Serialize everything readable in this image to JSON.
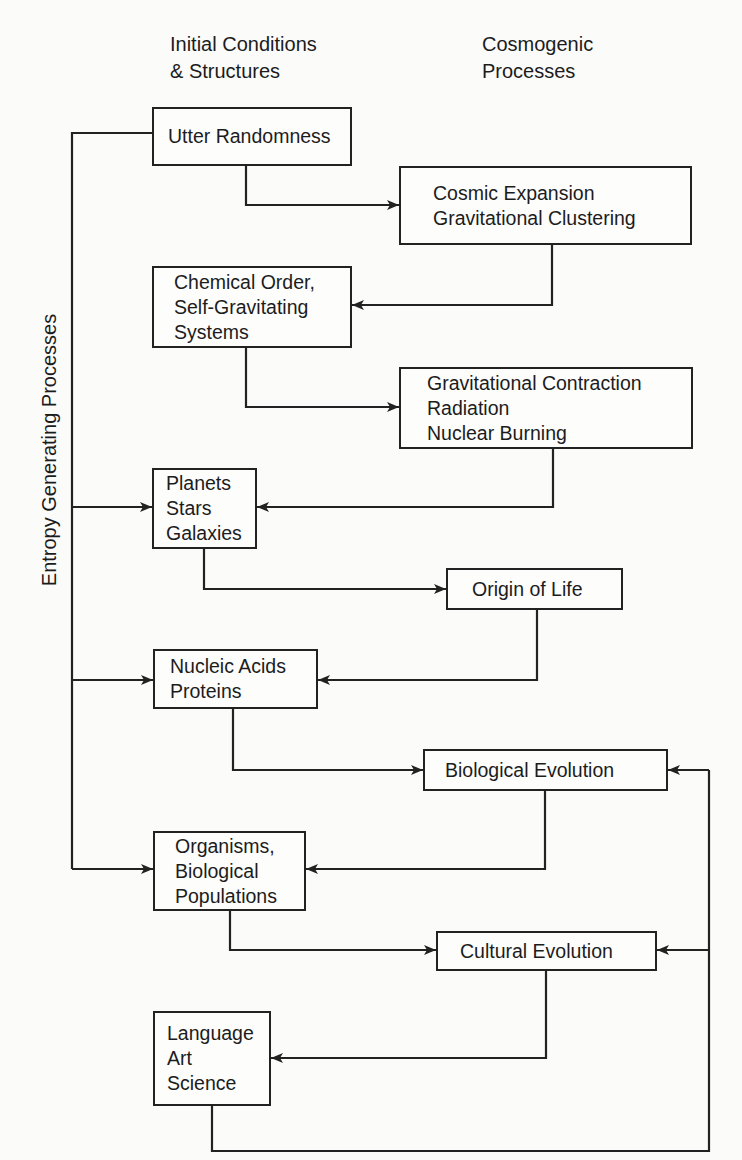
{
  "headings": {
    "left": "Initial Conditions\n& Structures",
    "right": "Cosmogenic\nProcesses"
  },
  "side_label": "Entropy Generating Processes",
  "structures": [
    {
      "id": "utter-randomness",
      "label": "Utter Randomness"
    },
    {
      "id": "chemical-order",
      "label": "Chemical Order,\nSelf-Gravitating\nSystems"
    },
    {
      "id": "planets-stars-galaxies",
      "label": "Planets\nStars\nGalaxies"
    },
    {
      "id": "nucleic-acids-proteins",
      "label": "Nucleic Acids\nProteins"
    },
    {
      "id": "organisms-populations",
      "label": "Organisms,\nBiological\nPopulations"
    },
    {
      "id": "language-art-science",
      "label": "Language\nArt\nScience"
    }
  ],
  "processes": [
    {
      "id": "cosmic-expansion",
      "label": "Cosmic Expansion\nGravitational Clustering"
    },
    {
      "id": "gravitational-contraction",
      "label": "Gravitational Contraction\nRadiation\nNuclear Burning"
    },
    {
      "id": "origin-of-life",
      "label": "Origin of Life"
    },
    {
      "id": "biological-evolution",
      "label": "Biological Evolution"
    },
    {
      "id": "cultural-evolution",
      "label": "Cultural Evolution"
    }
  ],
  "flow": [
    [
      "Utter Randomness",
      "Cosmic Expansion Gravitational Clustering"
    ],
    [
      "Cosmic Expansion Gravitational Clustering",
      "Chemical Order, Self-Gravitating Systems"
    ],
    [
      "Chemical Order, Self-Gravitating Systems",
      "Gravitational Contraction Radiation Nuclear Burning"
    ],
    [
      "Gravitational Contraction Radiation Nuclear Burning",
      "Planets Stars Galaxies"
    ],
    [
      "Planets Stars Galaxies",
      "Origin of Life"
    ],
    [
      "Origin of Life",
      "Nucleic Acids Proteins"
    ],
    [
      "Nucleic Acids Proteins",
      "Biological Evolution"
    ],
    [
      "Biological Evolution",
      "Organisms, Biological Populations"
    ],
    [
      "Organisms, Biological Populations",
      "Cultural Evolution"
    ],
    [
      "Cultural Evolution",
      "Language Art Science"
    ],
    [
      "Language Art Science",
      "Cultural Evolution"
    ],
    [
      "Language Art Science",
      "Biological Evolution"
    ],
    [
      "Utter Randomness",
      "Planets Stars Galaxies"
    ],
    [
      "Utter Randomness",
      "Nucleic Acids Proteins"
    ],
    [
      "Utter Randomness",
      "Organisms, Biological Populations"
    ]
  ],
  "colors": {
    "line": "#222222",
    "background": "#fbfbfa",
    "text": "#1c1c1c"
  }
}
